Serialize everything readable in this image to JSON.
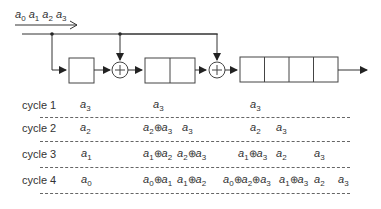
{
  "input_sequence": "a0 a1 a2 a3",
  "input_terms": [
    {
      "base": "a",
      "sub": "0"
    },
    {
      "base": "a",
      "sub": "1"
    },
    {
      "base": "a",
      "sub": "2"
    },
    {
      "base": "a",
      "sub": "3"
    }
  ],
  "diagram": {
    "stages": [
      {
        "name": "register-1",
        "cells": 1
      },
      {
        "name": "xor-1",
        "symbol": "+"
      },
      {
        "name": "register-2",
        "cells": 2
      },
      {
        "name": "xor-2",
        "symbol": "+"
      },
      {
        "name": "register-3",
        "cells": 4
      }
    ]
  },
  "xor_symbol": "⊕",
  "cycles": [
    {
      "label": "cycle 1",
      "cells": [
        {
          "x": 80,
          "text": "a3",
          "parts": [
            [
              "a",
              "3"
            ]
          ]
        },
        {
          "x": 153,
          "text": "a3",
          "parts": [
            [
              "a",
              "3"
            ]
          ]
        },
        {
          "x": 250,
          "text": "a3",
          "parts": [
            [
              "a",
              "3"
            ]
          ]
        }
      ]
    },
    {
      "label": "cycle 2",
      "cells": [
        {
          "x": 80,
          "text": "a2",
          "parts": [
            [
              "a",
              "2"
            ]
          ]
        },
        {
          "x": 143,
          "text": "a2⊕a3",
          "parts": [
            [
              "a",
              "2"
            ],
            [
              "a",
              "3"
            ]
          ]
        },
        {
          "x": 182,
          "text": "a3",
          "parts": [
            [
              "a",
              "3"
            ]
          ]
        },
        {
          "x": 250,
          "text": "a2",
          "parts": [
            [
              "a",
              "2"
            ]
          ]
        },
        {
          "x": 276,
          "text": "a3",
          "parts": [
            [
              "a",
              "3"
            ]
          ]
        }
      ]
    },
    {
      "label": "cycle 3",
      "cells": [
        {
          "x": 81,
          "text": "a1",
          "parts": [
            [
              "a",
              "1"
            ]
          ]
        },
        {
          "x": 143,
          "text": "a1⊕a2",
          "parts": [
            [
              "a",
              "1"
            ],
            [
              "a",
              "2"
            ]
          ]
        },
        {
          "x": 177,
          "text": "a2⊕a3",
          "parts": [
            [
              "a",
              "2"
            ],
            [
              "a",
              "3"
            ]
          ]
        },
        {
          "x": 238,
          "text": "a1⊕a3",
          "parts": [
            [
              "a",
              "1"
            ],
            [
              "a",
              "3"
            ]
          ]
        },
        {
          "x": 276,
          "text": "a2",
          "parts": [
            [
              "a",
              "2"
            ]
          ]
        },
        {
          "x": 314,
          "text": "a3",
          "parts": [
            [
              "a",
              "3"
            ]
          ]
        }
      ]
    },
    {
      "label": "cycle 4",
      "cells": [
        {
          "x": 81,
          "text": "a0",
          "parts": [
            [
              "a",
              "0"
            ]
          ]
        },
        {
          "x": 143,
          "text": "a0⊕a1",
          "parts": [
            [
              "a",
              "0"
            ],
            [
              "a",
              "1"
            ]
          ]
        },
        {
          "x": 177,
          "text": "a1⊕a2",
          "parts": [
            [
              "a",
              "1"
            ],
            [
              "a",
              "2"
            ]
          ]
        },
        {
          "x": 223,
          "text": "a0⊕a2⊕a3",
          "parts": [
            [
              "a",
              "0"
            ],
            [
              "a",
              "2"
            ],
            [
              "a",
              "3"
            ]
          ]
        },
        {
          "x": 279,
          "text": "a1⊕a3",
          "parts": [
            [
              "a",
              "1"
            ],
            [
              "a",
              "3"
            ]
          ]
        },
        {
          "x": 314,
          "text": "a2",
          "parts": [
            [
              "a",
              "2"
            ]
          ]
        },
        {
          "x": 338,
          "text": "a3",
          "parts": [
            [
              "a",
              "3"
            ]
          ]
        }
      ]
    }
  ]
}
